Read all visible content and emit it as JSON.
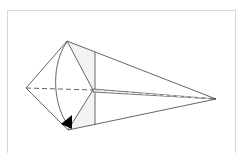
{
  "diagram": {
    "type": "origami-fold-step",
    "colors": {
      "line": "#555555",
      "shade": "#f2f2f2",
      "arrow": "#000000",
      "frame": "#d8d8d8"
    },
    "points": {
      "left": [
        26,
        88
      ],
      "top": [
        67,
        41
      ],
      "bottom": [
        68,
        130
      ],
      "center": [
        93,
        90
      ],
      "right_tip": [
        216,
        99
      ],
      "crease_top": [
        95,
        52
      ],
      "crease_bottom": [
        95,
        125
      ]
    }
  }
}
